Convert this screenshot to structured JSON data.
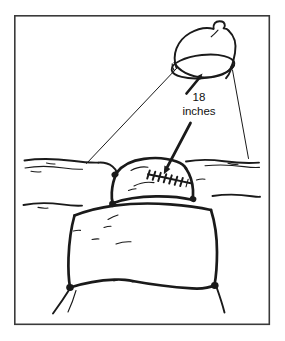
{
  "figure": {
    "name": "surgical-lamp-distance-illustration",
    "type": "line-art-medical-illustration",
    "background_color": "#ffffff",
    "ink_color": "#1a1a1a",
    "frame": {
      "name": "illustration-border",
      "stroke_color": "#3a3a3a",
      "x": 14,
      "y": 15,
      "width": 256,
      "height": 310
    }
  },
  "callout": {
    "name": "distance-callout",
    "line1": "18",
    "line2": "inches",
    "full_text": "18 inches",
    "value": 18,
    "unit": "inches",
    "text_x": 199,
    "line1_y": 101,
    "line2_y": 115,
    "font_size_px": 11.5,
    "arrow_up": {
      "name": "arrow-to-lamp",
      "from_x": 188,
      "from_y": 92,
      "to_x": 202,
      "to_y": 74,
      "points_to": "lamp-rim"
    },
    "arrow_down": {
      "name": "arrow-to-incision",
      "from_x": 190,
      "from_y": 122,
      "to_x": 164,
      "to_y": 172,
      "points_to": "sutured-incision"
    }
  },
  "lamp": {
    "name": "surgical-lamp",
    "shade_shape": "dome",
    "opening_shape": "ellipse",
    "knob": "top-mounted-fixture-knob",
    "center_x": 205,
    "center_y": 50,
    "rim_center_x": 203,
    "rim_center_y": 66,
    "rim_rx": 31,
    "rim_ry": 11
  },
  "light_beam": {
    "name": "light-beam-cone",
    "left_line": {
      "x1": 176,
      "y1": 68,
      "x2": 86,
      "y2": 163
    },
    "right_line": {
      "x1": 233,
      "y1": 70,
      "x2": 248,
      "y2": 158
    }
  },
  "patient": {
    "name": "draped-patient-torso",
    "drape": "surgical-drape-sheets",
    "exposed_region": "abdomen",
    "incision": {
      "name": "sutured-incision",
      "closure_type": "sutures",
      "suture_count": 8,
      "start_x": 148,
      "start_y": 174,
      "end_x": 190,
      "end_y": 183
    }
  }
}
